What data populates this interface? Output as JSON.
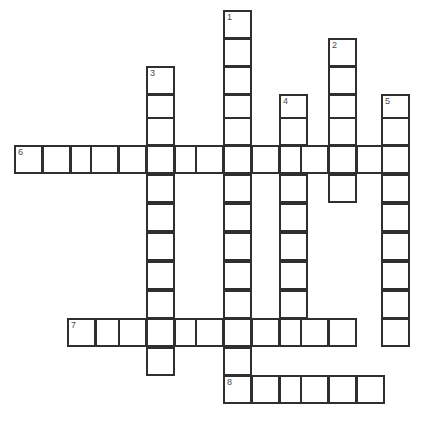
{
  "puzzle": {
    "title": "Crossword Puzzle Grid",
    "type": "crossword-grid",
    "background_color": "#ffffff",
    "cell_border_color": "#2f2f2f",
    "number_color": "#4a4a4a",
    "cell_size_px": 29,
    "canvas": {
      "width": 430,
      "height": 425
    },
    "clue_numbers": [
      "1",
      "2",
      "3",
      "4",
      "5",
      "6",
      "7",
      "8"
    ],
    "entries": [
      {
        "number": "1",
        "direction": "down",
        "length": 13,
        "start": {
          "x": 223,
          "y": 10
        },
        "cells": [
          {
            "x": 223,
            "y": 10
          },
          {
            "x": 223,
            "y": 38
          },
          {
            "x": 223,
            "y": 66
          },
          {
            "x": 223,
            "y": 94
          },
          {
            "x": 223,
            "y": 117
          },
          {
            "x": 223,
            "y": 145
          },
          {
            "x": 223,
            "y": 174
          },
          {
            "x": 223,
            "y": 203
          },
          {
            "x": 223,
            "y": 232
          },
          {
            "x": 223,
            "y": 261
          },
          {
            "x": 223,
            "y": 290
          },
          {
            "x": 223,
            "y": 318
          },
          {
            "x": 223,
            "y": 347
          },
          {
            "x": 223,
            "y": 375
          }
        ]
      },
      {
        "number": "2",
        "direction": "down",
        "length": 7,
        "start": {
          "x": 328,
          "y": 38
        },
        "cells": [
          {
            "x": 328,
            "y": 38
          },
          {
            "x": 328,
            "y": 66
          },
          {
            "x": 328,
            "y": 94
          },
          {
            "x": 328,
            "y": 117
          },
          {
            "x": 328,
            "y": 145
          },
          {
            "x": 328,
            "y": 174
          },
          {
            "x": 328,
            "y": 190
          }
        ]
      },
      {
        "number": "3",
        "direction": "down",
        "length": 12,
        "start": {
          "x": 146,
          "y": 66
        },
        "cells": [
          {
            "x": 146,
            "y": 66
          },
          {
            "x": 146,
            "y": 94
          },
          {
            "x": 146,
            "y": 117
          },
          {
            "x": 146,
            "y": 145
          },
          {
            "x": 146,
            "y": 174
          },
          {
            "x": 146,
            "y": 203
          },
          {
            "x": 146,
            "y": 232
          },
          {
            "x": 146,
            "y": 261
          },
          {
            "x": 146,
            "y": 290
          },
          {
            "x": 146,
            "y": 318
          },
          {
            "x": 146,
            "y": 347
          }
        ]
      },
      {
        "number": "4",
        "direction": "down",
        "length": 10,
        "start": {
          "x": 279,
          "y": 94
        },
        "cells": [
          {
            "x": 279,
            "y": 94
          },
          {
            "x": 279,
            "y": 117
          },
          {
            "x": 279,
            "y": 145
          },
          {
            "x": 279,
            "y": 174
          },
          {
            "x": 279,
            "y": 203
          },
          {
            "x": 279,
            "y": 232
          },
          {
            "x": 279,
            "y": 261
          },
          {
            "x": 279,
            "y": 290
          },
          {
            "x": 279,
            "y": 318
          }
        ]
      },
      {
        "number": "5",
        "direction": "down",
        "length": 10,
        "start": {
          "x": 381,
          "y": 94
        },
        "cells": [
          {
            "x": 381,
            "y": 94
          },
          {
            "x": 381,
            "y": 117
          },
          {
            "x": 381,
            "y": 145
          },
          {
            "x": 381,
            "y": 174
          },
          {
            "x": 381,
            "y": 203
          },
          {
            "x": 381,
            "y": 232
          },
          {
            "x": 381,
            "y": 261
          },
          {
            "x": 381,
            "y": 290
          },
          {
            "x": 381,
            "y": 318
          }
        ]
      },
      {
        "number": "6",
        "direction": "across",
        "length": 14,
        "start": {
          "x": 14,
          "y": 145
        },
        "cells": [
          {
            "x": 14,
            "y": 145
          },
          {
            "x": 42,
            "y": 145
          },
          {
            "x": 70,
            "y": 145
          },
          {
            "x": 90,
            "y": 145
          },
          {
            "x": 118,
            "y": 145
          },
          {
            "x": 146,
            "y": 145
          },
          {
            "x": 174,
            "y": 145
          },
          {
            "x": 195,
            "y": 145
          },
          {
            "x": 223,
            "y": 145
          },
          {
            "x": 251,
            "y": 145
          },
          {
            "x": 279,
            "y": 145
          },
          {
            "x": 300,
            "y": 145
          },
          {
            "x": 328,
            "y": 145
          },
          {
            "x": 356,
            "y": 145
          },
          {
            "x": 381,
            "y": 145
          }
        ]
      },
      {
        "number": "7",
        "direction": "across",
        "length": 11,
        "start": {
          "x": 67,
          "y": 318
        },
        "cells": [
          {
            "x": 67,
            "y": 318
          },
          {
            "x": 95,
            "y": 318
          },
          {
            "x": 118,
            "y": 318
          },
          {
            "x": 146,
            "y": 318
          },
          {
            "x": 174,
            "y": 318
          },
          {
            "x": 195,
            "y": 318
          },
          {
            "x": 223,
            "y": 318
          },
          {
            "x": 251,
            "y": 318
          },
          {
            "x": 279,
            "y": 318
          },
          {
            "x": 300,
            "y": 318
          },
          {
            "x": 328,
            "y": 318
          }
        ]
      },
      {
        "number": "8",
        "direction": "across",
        "length": 6,
        "start": {
          "x": 223,
          "y": 375
        },
        "cells": [
          {
            "x": 223,
            "y": 375
          },
          {
            "x": 251,
            "y": 375
          },
          {
            "x": 279,
            "y": 375
          },
          {
            "x": 300,
            "y": 375
          },
          {
            "x": 328,
            "y": 375
          },
          {
            "x": 356,
            "y": 375
          }
        ]
      }
    ],
    "cells": [
      {
        "x": 223,
        "y": 10,
        "num": "1"
      },
      {
        "x": 223,
        "y": 38
      },
      {
        "x": 328,
        "y": 38,
        "num": "2"
      },
      {
        "x": 223,
        "y": 66
      },
      {
        "x": 146,
        "y": 66,
        "num": "3"
      },
      {
        "x": 328,
        "y": 66
      },
      {
        "x": 146,
        "y": 94
      },
      {
        "x": 223,
        "y": 94
      },
      {
        "x": 279,
        "y": 94,
        "num": "4"
      },
      {
        "x": 328,
        "y": 94
      },
      {
        "x": 381,
        "y": 94,
        "num": "5"
      },
      {
        "x": 146,
        "y": 117
      },
      {
        "x": 223,
        "y": 117
      },
      {
        "x": 279,
        "y": 117
      },
      {
        "x": 328,
        "y": 117
      },
      {
        "x": 381,
        "y": 117
      },
      {
        "x": 14,
        "y": 145,
        "num": "6"
      },
      {
        "x": 42,
        "y": 145
      },
      {
        "x": 70,
        "y": 145
      },
      {
        "x": 90,
        "y": 145
      },
      {
        "x": 118,
        "y": 145
      },
      {
        "x": 146,
        "y": 145
      },
      {
        "x": 174,
        "y": 145
      },
      {
        "x": 195,
        "y": 145
      },
      {
        "x": 223,
        "y": 145
      },
      {
        "x": 251,
        "y": 145
      },
      {
        "x": 279,
        "y": 145
      },
      {
        "x": 300,
        "y": 145
      },
      {
        "x": 328,
        "y": 145
      },
      {
        "x": 356,
        "y": 145
      },
      {
        "x": 381,
        "y": 145
      },
      {
        "x": 146,
        "y": 174
      },
      {
        "x": 223,
        "y": 174
      },
      {
        "x": 279,
        "y": 174
      },
      {
        "x": 328,
        "y": 174
      },
      {
        "x": 381,
        "y": 174
      },
      {
        "x": 146,
        "y": 203
      },
      {
        "x": 223,
        "y": 203
      },
      {
        "x": 279,
        "y": 203
      },
      {
        "x": 381,
        "y": 203
      },
      {
        "x": 146,
        "y": 232
      },
      {
        "x": 223,
        "y": 232
      },
      {
        "x": 279,
        "y": 232
      },
      {
        "x": 381,
        "y": 232
      },
      {
        "x": 146,
        "y": 261
      },
      {
        "x": 223,
        "y": 261
      },
      {
        "x": 279,
        "y": 261
      },
      {
        "x": 381,
        "y": 261
      },
      {
        "x": 146,
        "y": 290
      },
      {
        "x": 223,
        "y": 290
      },
      {
        "x": 279,
        "y": 290
      },
      {
        "x": 381,
        "y": 290
      },
      {
        "x": 67,
        "y": 318,
        "num": "7"
      },
      {
        "x": 95,
        "y": 318
      },
      {
        "x": 118,
        "y": 318
      },
      {
        "x": 146,
        "y": 318
      },
      {
        "x": 174,
        "y": 318
      },
      {
        "x": 195,
        "y": 318
      },
      {
        "x": 223,
        "y": 318
      },
      {
        "x": 251,
        "y": 318
      },
      {
        "x": 279,
        "y": 318
      },
      {
        "x": 300,
        "y": 318
      },
      {
        "x": 328,
        "y": 318
      },
      {
        "x": 381,
        "y": 318
      },
      {
        "x": 146,
        "y": 347
      },
      {
        "x": 223,
        "y": 347
      },
      {
        "x": 223,
        "y": 375,
        "num": "8"
      },
      {
        "x": 251,
        "y": 375
      },
      {
        "x": 279,
        "y": 375
      },
      {
        "x": 300,
        "y": 375
      },
      {
        "x": 328,
        "y": 375
      },
      {
        "x": 356,
        "y": 375
      }
    ]
  }
}
